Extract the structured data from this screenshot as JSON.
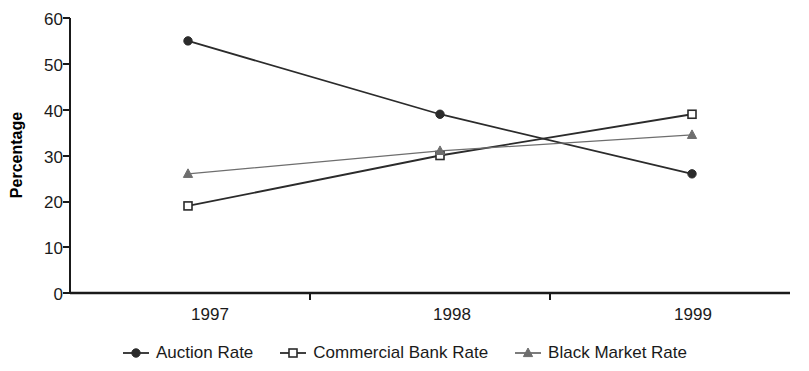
{
  "chart_data": {
    "type": "line",
    "title": "",
    "subtitle": "",
    "xlabel": "",
    "ylabel": "Percentage",
    "categories": [
      "1997",
      "1998",
      "1999"
    ],
    "ylim": [
      0,
      60
    ],
    "yticks": [
      0,
      10,
      20,
      30,
      40,
      50,
      60
    ],
    "ytick_labels": [
      "0",
      "10",
      "20",
      "30",
      "40",
      "50",
      "60"
    ],
    "grid": false,
    "legend_position": "bottom",
    "series": [
      {
        "name": "Auction Rate",
        "values": [
          55,
          39,
          26
        ],
        "marker": "filled-circle",
        "color": "#2b2b2b"
      },
      {
        "name": "Commercial Bank Rate",
        "values": [
          19,
          30,
          39
        ],
        "marker": "open-square",
        "color": "#2b2b2b"
      },
      {
        "name": "Black Market Rate",
        "values": [
          26,
          31,
          34.5
        ],
        "marker": "filled-triangle",
        "color": "#6e6e6e"
      }
    ]
  },
  "axis": {
    "y_label": "Percentage",
    "y_tick_0": "0",
    "y_tick_10": "10",
    "y_tick_20": "20",
    "y_tick_30": "30",
    "y_tick_40": "40",
    "y_tick_50": "50",
    "y_tick_60": "60",
    "x_tick_1997": "1997",
    "x_tick_1998": "1998",
    "x_tick_1999": "1999"
  },
  "legend": {
    "entries": [
      {
        "label": "Auction Rate",
        "marker": "filled-circle"
      },
      {
        "label": "Commercial Bank Rate",
        "marker": "open-square"
      },
      {
        "label": "Black Market Rate",
        "marker": "filled-triangle"
      }
    ]
  },
  "colors": {
    "axis": "#1a1a1a",
    "series_dark": "#2b2b2b",
    "series_light": "#6e6e6e",
    "background": "#ffffff"
  }
}
